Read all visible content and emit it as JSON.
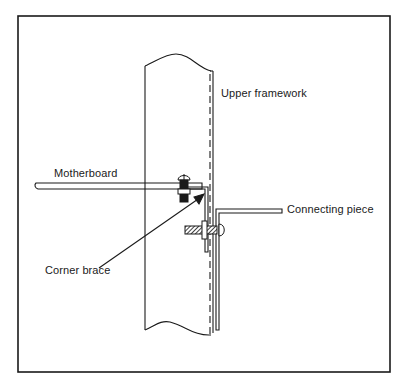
{
  "figure": {
    "labels": {
      "upper_framework": "Upper framework",
      "motherboard": "Motherboard",
      "connecting_piece": "Connecting piece",
      "corner_brace": "Corner brace"
    },
    "caption_cutoff": "(caption text cut off at bottom edge)"
  },
  "colors": {
    "line": "#1a1a1a",
    "background": "#ffffff"
  }
}
